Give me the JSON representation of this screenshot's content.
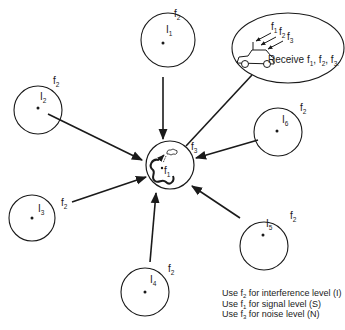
{
  "diagram": {
    "type": "co-channel interference model",
    "center": {
      "label": "f",
      "sub": "1",
      "outer_label": "f",
      "outer_sub": "3",
      "icon": "mobile-cell-icon"
    },
    "receiver": {
      "caption": "Receive f",
      "caption_parts": [
        {
          "t": "Receive f",
          "s": "1"
        },
        {
          "t": ", f",
          "s": "2"
        },
        {
          "t": ", f",
          "s": "3"
        }
      ],
      "arrows": [
        {
          "t": "f",
          "s": "1"
        },
        {
          "t": "f",
          "s": "2"
        },
        {
          "t": "f",
          "s": "3"
        }
      ],
      "icon": "car-icon"
    },
    "interferers": [
      {
        "id": "I1",
        "label": "I",
        "sub": "1",
        "freq": "f",
        "freq_sub": "2"
      },
      {
        "id": "I2",
        "label": "I",
        "sub": "2",
        "freq": "f",
        "freq_sub": "2"
      },
      {
        "id": "I3",
        "label": "I",
        "sub": "3",
        "freq": "f",
        "freq_sub": "2"
      },
      {
        "id": "I4",
        "label": "I",
        "sub": "4",
        "freq": "f",
        "freq_sub": "2"
      },
      {
        "id": "I5",
        "label": "I",
        "sub": "5",
        "freq": "f",
        "freq_sub": "2"
      },
      {
        "id": "I6",
        "label": "I",
        "sub": "6",
        "freq": "f",
        "freq_sub": "2"
      }
    ]
  },
  "legend": [
    {
      "pre": "Use f",
      "sub": "2",
      "post": " for interference level (I)"
    },
    {
      "pre": "Use f",
      "sub": "1",
      "post": " for signal level (S)"
    },
    {
      "pre": "Use f",
      "sub": "3",
      "post": " for noise level (N)"
    }
  ]
}
